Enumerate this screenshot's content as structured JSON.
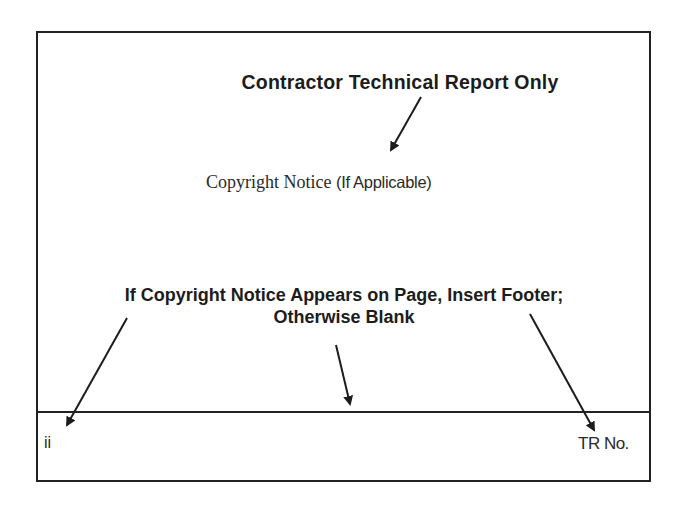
{
  "document": {
    "title": "Contractor Technical Report Only",
    "copyright_notice": {
      "serif_text": "Copyright Notice ",
      "sans_text": "(If Applicable)"
    },
    "instruction": {
      "line1": "If Copyright Notice Appears on Page, Insert Footer;",
      "line2": "Otherwise Blank"
    },
    "footer": {
      "left": "ii",
      "right": "TR No."
    },
    "colors": {
      "ink": "#1c1c1c",
      "background": "#ffffff"
    }
  }
}
